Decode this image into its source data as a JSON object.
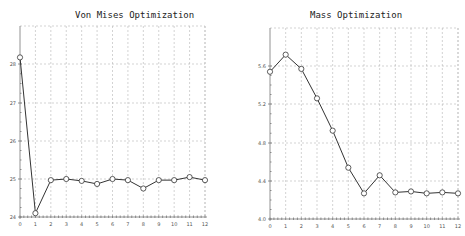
{
  "chart_data": [
    {
      "type": "line",
      "title": "Von Mises Optimization",
      "xlabel": "",
      "ylabel": "",
      "x": [
        0,
        1,
        2,
        3,
        4,
        5,
        6,
        7,
        8,
        9,
        10,
        11,
        12
      ],
      "series": [
        {
          "name": "Von Mises",
          "values": [
            28.2,
            24.1,
            24.97,
            25.0,
            24.95,
            24.87,
            25.0,
            24.97,
            24.75,
            24.97,
            24.97,
            25.05,
            24.97
          ]
        }
      ],
      "xticks": [
        "0",
        "1",
        "2",
        "3",
        "4",
        "5",
        "6",
        "7",
        "8",
        "9",
        "10",
        "11",
        "12"
      ],
      "yticks": [
        "24",
        "25",
        "26",
        "27",
        "28"
      ],
      "xlim": [
        0,
        12
      ],
      "ylim": [
        24,
        29
      ],
      "grid": true,
      "marker": "open-circle",
      "line_color": "#333333"
    },
    {
      "type": "line",
      "title": "Mass Optimization",
      "xlabel": "",
      "ylabel": "",
      "x": [
        0,
        1,
        2,
        3,
        4,
        5,
        6,
        7,
        8,
        9,
        10,
        11,
        12
      ],
      "series": [
        {
          "name": "Mass",
          "values": [
            5.55,
            5.73,
            5.58,
            5.27,
            4.93,
            4.54,
            4.27,
            4.46,
            4.28,
            4.29,
            4.27,
            4.28,
            4.27
          ]
        }
      ],
      "xticks": [
        "0",
        "1",
        "2",
        "3",
        "4",
        "5",
        "6",
        "7",
        "8",
        "9",
        "10",
        "11",
        "12"
      ],
      "yticks": [
        "4.0",
        "4.4",
        "4.8",
        "5.2",
        "5.6"
      ],
      "xlim": [
        0,
        12
      ],
      "ylim": [
        4.0,
        5.84
      ],
      "grid": true,
      "marker": "open-circle",
      "line_color": "#333333"
    }
  ]
}
